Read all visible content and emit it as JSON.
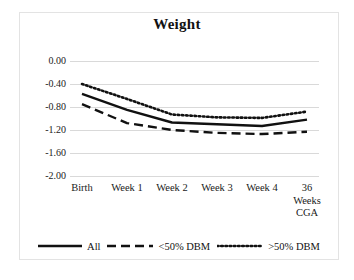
{
  "figure": {
    "background_color": "#ffffff",
    "frame_color": "#e3e3e3",
    "line_color": "#111111",
    "gridline_color": "#d9d9d9"
  },
  "chart_data": {
    "type": "line",
    "title": "Weight",
    "xlabel": "",
    "ylabel": "",
    "categories": [
      "Birth",
      "Week 1",
      "Week 2",
      "Week 3",
      "Week 4",
      "36\nWeeks\nCGA"
    ],
    "x_tick_labels": [
      "Birth",
      "Week 1",
      "Week 2",
      "Week 3",
      "Week 4",
      "36 Weeks CGA"
    ],
    "y_tick_labels": [
      "0.00",
      "-0.40",
      "-0.80",
      "-1.20",
      "-1.60",
      "-2.00"
    ],
    "y_tick_values": [
      0.0,
      -0.4,
      -0.8,
      -1.2,
      -1.6,
      -2.0
    ],
    "ylim": [
      -2.0,
      0.0
    ],
    "grid": true,
    "legend_position": "bottom",
    "series": [
      {
        "name": "All",
        "style": "solid",
        "values": [
          -0.57,
          -0.85,
          -1.07,
          -1.1,
          -1.13,
          -1.02
        ]
      },
      {
        "name": "<50% DBM",
        "style": "dashed",
        "values": [
          -0.75,
          -1.08,
          -1.2,
          -1.25,
          -1.27,
          -1.23
        ]
      },
      {
        "name": ">50% DBM",
        "style": "dotted",
        "values": [
          -0.4,
          -0.66,
          -0.93,
          -0.98,
          -0.99,
          -0.88
        ]
      }
    ]
  },
  "legend": {
    "items": [
      {
        "label": "All",
        "style": "solid"
      },
      {
        "label": "<50% DBM",
        "style": "dashed"
      },
      {
        "label": ">50% DBM",
        "style": "dotted"
      }
    ]
  }
}
